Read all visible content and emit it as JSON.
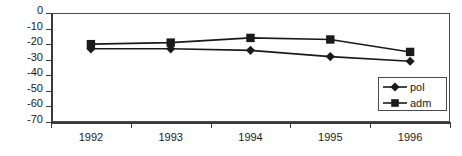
{
  "chart_data": {
    "type": "line",
    "title": "",
    "subtitle": "",
    "xlabel": "",
    "ylabel": "",
    "categories": [
      "1992",
      "1993",
      "1994",
      "1995",
      "1996"
    ],
    "series": [
      {
        "name": "pol",
        "marker": "diamond",
        "color": "#1a1a1a",
        "values": [
          -23,
          -23,
          -24,
          -28,
          -31
        ]
      },
      {
        "name": "adm",
        "marker": "square",
        "color": "#1a1a1a",
        "values": [
          -20,
          -19,
          -16,
          -17,
          -25
        ]
      }
    ],
    "ylim": [
      -70,
      0
    ],
    "ytick_values": [
      0,
      -10,
      -20,
      -30,
      -40,
      -50,
      -60,
      -70
    ],
    "ytick_labels": [
      "0",
      "-10",
      "-20",
      "-30",
      "-40",
      "-50",
      "-60",
      "-70"
    ],
    "xtick_labels": [
      "1992",
      "1993",
      "1994",
      "1995",
      "1996"
    ],
    "grid": false,
    "legend": {
      "position": "bottom-right-inside",
      "entries": [
        {
          "label": "pol",
          "marker": "diamond"
        },
        {
          "label": "adm",
          "marker": "square"
        }
      ]
    },
    "axis_color": "#3a3a3a",
    "plot_background": "#ffffff"
  }
}
